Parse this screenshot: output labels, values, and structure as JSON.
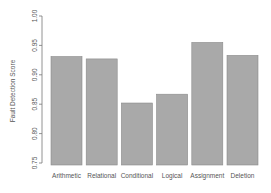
{
  "chart_data": {
    "type": "bar",
    "title": "",
    "xlabel": "",
    "ylabel": "Fault Detection Score",
    "ylim": [
      0.75,
      1.0
    ],
    "yticks": [
      "0.75",
      "0.80",
      "0.85",
      "0.90",
      "0.95",
      "1.00"
    ],
    "categories": [
      "Arithmetic",
      "Relational",
      "Conditional",
      "Logical",
      "Assignment",
      "Deletion"
    ],
    "values": [
      0.931,
      0.927,
      0.852,
      0.867,
      0.955,
      0.933
    ],
    "grid": false,
    "legend": null,
    "colors": {
      "bar_fill": "#a9a9a9",
      "bar_border": "#8a8a8a",
      "axis": "#777777",
      "text": "#555555"
    }
  }
}
